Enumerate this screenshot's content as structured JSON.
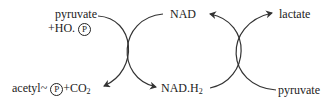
{
  "diagram": {
    "type": "coupled-reaction-cycles",
    "left_reaction": {
      "substrate_line1": "pyruvate",
      "substrate_line2_prefix": "+HO.",
      "phosphate_symbol": "P",
      "product_prefix": "acetyl",
      "product_tilde": "~",
      "product_suffix": "+CO",
      "product_co2_subscript": "2"
    },
    "cofactor_top": "NAD",
    "cofactor_bottom": "NAD.H",
    "cofactor_bottom_subscript": "2",
    "right_reaction": {
      "product": "lactate",
      "substrate": "pyruvate"
    },
    "colors": {
      "line": "#333333",
      "text": "#222222",
      "background": "#ffffff"
    }
  }
}
